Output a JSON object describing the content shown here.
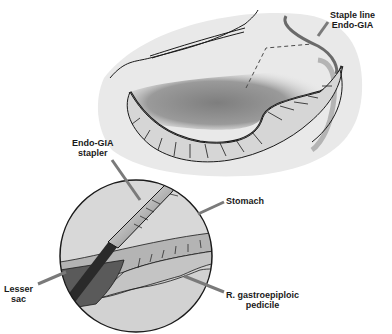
{
  "figure": {
    "type": "surgical-illustration",
    "colors": {
      "background": "#ffffff",
      "field": "#e8e8e8",
      "shadow": "#8a8a8a",
      "omentum": "#d4d4d4",
      "outline": "#1a1a1a",
      "leader": "#7a7a7a",
      "circle_fill": "#cfcfcf",
      "lesser_sac": "#5a5a5a",
      "stapler_body": "#bdbdbd"
    }
  },
  "labels": {
    "staple_line": {
      "line1": "Staple line",
      "line2": "Endo-GIA"
    },
    "stapler": {
      "line1": "Endo-GIA",
      "line2": "stapler"
    },
    "stomach": {
      "line1": "Stomach"
    },
    "lesser_sac": {
      "line1": "Lesser",
      "line2": "sac"
    },
    "pedicle": {
      "line1": "R. gastroepiploic",
      "line2": "pedicile"
    }
  }
}
